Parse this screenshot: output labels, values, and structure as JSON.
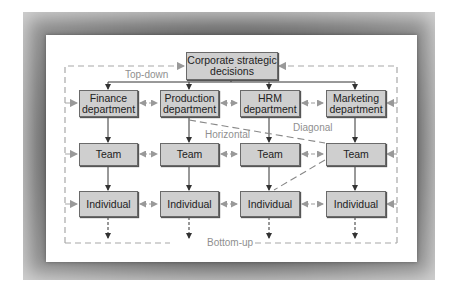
{
  "diagram": {
    "top": {
      "label": "Corporate strategic decisions"
    },
    "departments": [
      {
        "label": "Finance department"
      },
      {
        "label": "Production department"
      },
      {
        "label": "HRM department"
      },
      {
        "label": "Marketing department"
      }
    ],
    "teams": [
      {
        "label": "Team"
      },
      {
        "label": "Team"
      },
      {
        "label": "Team"
      },
      {
        "label": "Team"
      }
    ],
    "individuals": [
      {
        "label": "Individual"
      },
      {
        "label": "Individual"
      },
      {
        "label": "Individual"
      },
      {
        "label": "Individual"
      }
    ],
    "flow_labels": {
      "top_down": "Top-down",
      "horizontal": "Horizontal",
      "diagonal": "Diagonal",
      "bottom_up": "Bottom-up"
    },
    "colors": {
      "box_fill": "#cfcfcf",
      "frame": "#7a7a7a",
      "dashed_line": "#a8a8a8",
      "label_text": "#8f8f8f"
    }
  }
}
